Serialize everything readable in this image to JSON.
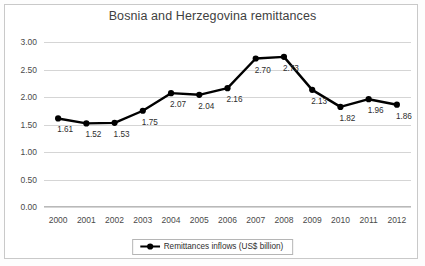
{
  "chart_data": {
    "type": "line",
    "title": "Bosnia and Herzegovina remittances",
    "xlabel": "",
    "ylabel": "",
    "categories": [
      "2000",
      "2001",
      "2002",
      "2003",
      "2004",
      "2005",
      "2006",
      "2007",
      "2008",
      "2009",
      "2010",
      "2011",
      "2012"
    ],
    "values": [
      1.61,
      1.52,
      1.53,
      1.75,
      2.07,
      2.04,
      2.16,
      2.7,
      2.73,
      2.13,
      1.82,
      1.96,
      1.86
    ],
    "point_labels": [
      "1.61",
      "1.52",
      "1.53",
      "1.75",
      "2.07",
      "2.04",
      "2.16",
      "2.70",
      "2.73",
      "2.13",
      "1.82",
      "1.96",
      "1.86"
    ],
    "ylim": [
      0.0,
      3.0
    ],
    "ytick_labels": [
      "0.00",
      "0.50",
      "1.00",
      "1.50",
      "2.00",
      "2.50",
      "3.00"
    ],
    "ytick_values": [
      0.0,
      0.5,
      1.0,
      1.5,
      2.0,
      2.5,
      3.0
    ],
    "grid": true,
    "legend_position": "bottom-center",
    "series": [
      {
        "name": "Remittances inflows (US$ billion)",
        "color": "#000000",
        "marker": "circle",
        "values": [
          1.61,
          1.52,
          1.53,
          1.75,
          2.07,
          2.04,
          2.16,
          2.7,
          2.73,
          2.13,
          1.82,
          1.96,
          1.86
        ]
      }
    ]
  },
  "legend": {
    "entries": [
      {
        "label": "Remittances inflows (US$ billion)",
        "marker_icon": "line-marker-icon"
      }
    ]
  },
  "colors": {
    "series": "#000000",
    "gridline": "#d5d5d5",
    "title_text": "#3f3f3f",
    "tick_text": "#4a4a4a",
    "frame": "#c9c9c9",
    "background": "#ffffff"
  }
}
